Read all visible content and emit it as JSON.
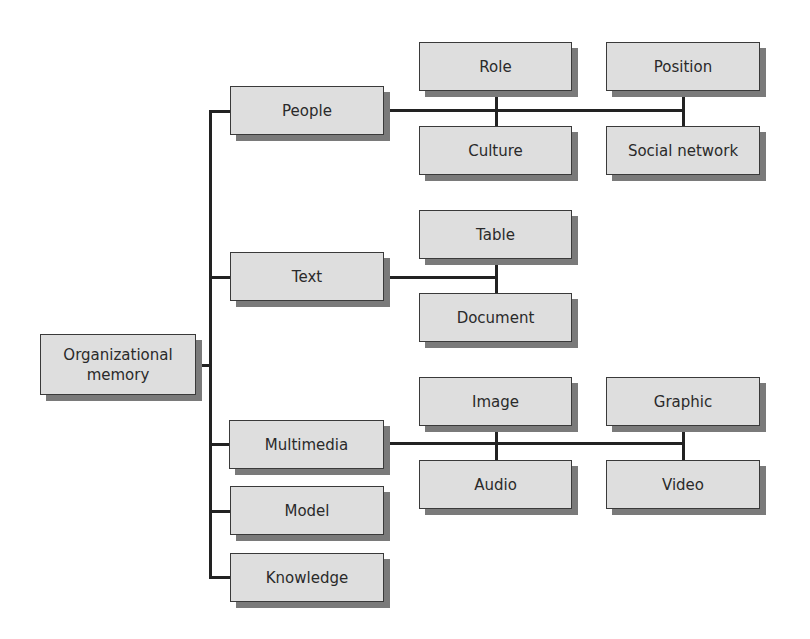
{
  "diagram": {
    "type": "hierarchy",
    "root": {
      "id": "org-memory",
      "label": "Organizational\nmemory"
    },
    "categories": [
      {
        "id": "people",
        "label": "People",
        "children": [
          {
            "id": "role",
            "label": "Role"
          },
          {
            "id": "position",
            "label": "Position"
          },
          {
            "id": "culture",
            "label": "Culture"
          },
          {
            "id": "social-network",
            "label": "Social network"
          }
        ]
      },
      {
        "id": "text",
        "label": "Text",
        "children": [
          {
            "id": "table",
            "label": "Table"
          },
          {
            "id": "document",
            "label": "Document"
          }
        ]
      },
      {
        "id": "multimedia",
        "label": "Multimedia",
        "children": [
          {
            "id": "image",
            "label": "Image"
          },
          {
            "id": "graphic",
            "label": "Graphic"
          },
          {
            "id": "audio",
            "label": "Audio"
          },
          {
            "id": "video",
            "label": "Video"
          }
        ]
      },
      {
        "id": "model",
        "label": "Model",
        "children": []
      },
      {
        "id": "knowledge",
        "label": "Knowledge",
        "children": []
      }
    ]
  },
  "colors": {
    "box_fill": "#dedede",
    "box_border": "#3a3a3a",
    "shadow": "#7a7a7a",
    "connector": "#222222",
    "text": "#2a2a2a"
  }
}
